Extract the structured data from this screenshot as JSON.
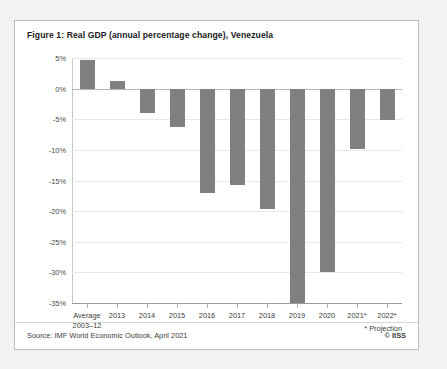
{
  "figure": {
    "title": "Figure 1: Real GDP (annual percentage change), Venezuela",
    "source": "Source: IMF World Economic Outlook, April 2021",
    "copyright": "© IISS",
    "projection_note": "* Projection"
  },
  "colors": {
    "bar": "#808080",
    "panel_background": "#ffffff",
    "page_background": "#f2f2f2",
    "panel_border": "#bdbdbd",
    "gridline": "#e8e8e8",
    "zero_line": "#b5b5b5",
    "text": "#3d3d3d"
  },
  "chart_data": {
    "type": "bar",
    "title": "Figure 1: Real GDP (annual percentage change), Venezuela",
    "xlabel": "",
    "ylabel": "",
    "ylim": [
      -35,
      5
    ],
    "ytick_values": [
      5,
      0,
      -5,
      -10,
      -15,
      -20,
      -25,
      -30,
      -35
    ],
    "ytick_labels": [
      "5%",
      "0%",
      "-5%",
      "-10%",
      "-15%",
      "-20%",
      "-25%",
      "-30%",
      "-35%"
    ],
    "grid": true,
    "legend": false,
    "categories": [
      "Average\n2003–12",
      "2013",
      "2014",
      "2015",
      "2016",
      "2017",
      "2018",
      "2019",
      "2020",
      "2021*",
      "2022*"
    ],
    "values": [
      4.6,
      1.3,
      -3.9,
      -6.2,
      -17.0,
      -15.8,
      -19.6,
      -35.0,
      -30.0,
      -9.8,
      -5.2
    ],
    "annotations": [
      "* Projection"
    ],
    "source": "Source: IMF World Economic Outlook, April 2021"
  }
}
